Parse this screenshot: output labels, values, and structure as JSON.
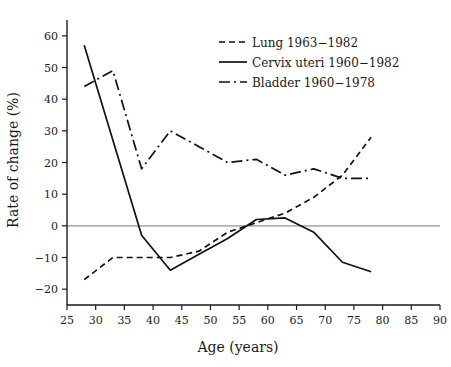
{
  "chart_data": {
    "type": "line",
    "title": "",
    "xlabel": "Age (years)",
    "ylabel": "Rate of change (%)",
    "xlim": [
      25,
      90
    ],
    "ylim": [
      -25,
      65
    ],
    "xticks": [
      25,
      30,
      35,
      40,
      45,
      50,
      55,
      60,
      65,
      70,
      75,
      80,
      85,
      90
    ],
    "yticks": [
      -20,
      -10,
      0,
      10,
      20,
      30,
      40,
      50,
      60
    ],
    "xtick_labels": [
      "25",
      "30",
      "35",
      "40",
      "45",
      "50",
      "55",
      "60",
      "65",
      "70",
      "75",
      "80",
      "85",
      "90"
    ],
    "ytick_labels": [
      "-20",
      "-10",
      "0",
      "10",
      "20",
      "30",
      "40",
      "50",
      "60"
    ],
    "grid": false,
    "zero_reference_line": true,
    "legend_position": "top-right",
    "series": [
      {
        "name": "Lung 1963-1982",
        "style": "dashed",
        "color": "#111111",
        "x": [
          28,
          33,
          38,
          43,
          48,
          53,
          58,
          63,
          68,
          73,
          78
        ],
        "values": [
          -17,
          -10,
          -10,
          -10,
          -8,
          -2,
          1,
          4,
          9,
          16,
          28
        ]
      },
      {
        "name": "Cervix uteri 1960-1982",
        "style": "solid",
        "color": "#111111",
        "x": [
          28,
          33,
          38,
          43,
          48,
          53,
          58,
          63,
          68,
          73,
          78
        ],
        "values": [
          57,
          27,
          -3,
          -14,
          -9,
          -4,
          2,
          2.5,
          -2,
          -11.5,
          -14.5
        ]
      },
      {
        "name": "Bladder 1960-1978",
        "style": "dashdot",
        "color": "#111111",
        "x": [
          28,
          33,
          38,
          43,
          48,
          53,
          58,
          63,
          68,
          73,
          78
        ],
        "values": [
          44,
          49,
          18,
          30,
          25,
          20,
          21,
          16,
          18,
          15,
          15
        ]
      }
    ]
  },
  "legend": {
    "entries": [
      {
        "label": "Lung 1963-1982"
      },
      {
        "label": "Cervix uteri 1960-1982"
      },
      {
        "label": "Bladder 1960-1978"
      }
    ]
  },
  "axes": {
    "x_title": "Age (years)",
    "y_title": "Rate of change (%)"
  }
}
